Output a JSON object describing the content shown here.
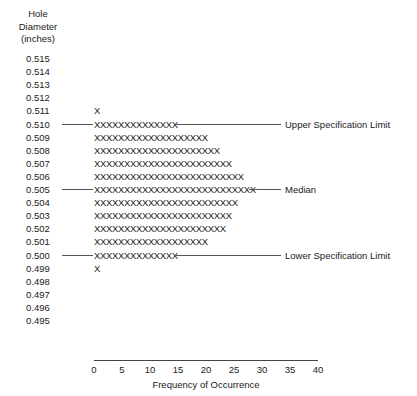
{
  "chart_data": {
    "type": "bar",
    "orientation": "horizontal",
    "title": "",
    "ylabel": "Hole Diameter (inches)",
    "xlabel": "Frequency of Occurrence",
    "xlim": [
      0,
      40
    ],
    "xticks": [
      0,
      5,
      10,
      15,
      20,
      25,
      30,
      35,
      40
    ],
    "grid": false,
    "legend": false,
    "mark_glyph": "X",
    "categories": [
      "0.515",
      "0.514",
      "0.513",
      "0.512",
      "0.511",
      "0.510",
      "0.509",
      "0.508",
      "0.507",
      "0.506",
      "0.505",
      "0.504",
      "0.503",
      "0.502",
      "0.501",
      "0.500",
      "0.499",
      "0.498",
      "0.497",
      "0.496",
      "0.495"
    ],
    "values": [
      0,
      0,
      0,
      0,
      1,
      14,
      19,
      21,
      23,
      25,
      27,
      24,
      23,
      22,
      19,
      14,
      1,
      0,
      0,
      0,
      0
    ],
    "annotations": [
      {
        "category": "0.510",
        "text": "Upper Specification Limit"
      },
      {
        "category": "0.505",
        "text": "Median"
      },
      {
        "category": "0.500",
        "text": "Lower Specification Limit"
      }
    ]
  },
  "y_axis_title": {
    "line1": "Hole",
    "line2": "Diameter",
    "line3": "(inches)"
  },
  "x_axis": {
    "title": "Frequency of Occurrence",
    "ticks": [
      "0",
      "5",
      "10",
      "15",
      "20",
      "25",
      "30",
      "35",
      "40"
    ]
  },
  "rows": [
    {
      "label": "0.515",
      "marks": "",
      "annotation": ""
    },
    {
      "label": "0.514",
      "marks": "",
      "annotation": ""
    },
    {
      "label": "0.513",
      "marks": "",
      "annotation": ""
    },
    {
      "label": "0.512",
      "marks": "",
      "annotation": ""
    },
    {
      "label": "0.511",
      "marks": "X",
      "annotation": ""
    },
    {
      "label": "0.510",
      "marks": "XXXXXXXXXXXXXX",
      "annotation": "Upper Specification Limit"
    },
    {
      "label": "0.509",
      "marks": "XXXXXXXXXXXXXXXXXXX",
      "annotation": ""
    },
    {
      "label": "0.508",
      "marks": "XXXXXXXXXXXXXXXXXXXXX",
      "annotation": ""
    },
    {
      "label": "0.507",
      "marks": "XXXXXXXXXXXXXXXXXXXXXXX",
      "annotation": ""
    },
    {
      "label": "0.506",
      "marks": "XXXXXXXXXXXXXXXXXXXXXXXXX",
      "annotation": ""
    },
    {
      "label": "0.505",
      "marks": "XXXXXXXXXXXXXXXXXXXXXXXXXXX",
      "annotation": "Median"
    },
    {
      "label": "0.504",
      "marks": "XXXXXXXXXXXXXXXXXXXXXXXX",
      "annotation": ""
    },
    {
      "label": "0.503",
      "marks": "XXXXXXXXXXXXXXXXXXXXXXX",
      "annotation": ""
    },
    {
      "label": "0.502",
      "marks": "XXXXXXXXXXXXXXXXXXXXXX",
      "annotation": ""
    },
    {
      "label": "0.501",
      "marks": "XXXXXXXXXXXXXXXXXXX",
      "annotation": ""
    },
    {
      "label": "0.500",
      "marks": "XXXXXXXXXXXXXX",
      "annotation": "Lower Specification Limit"
    },
    {
      "label": "0.499",
      "marks": "X",
      "annotation": ""
    },
    {
      "label": "0.498",
      "marks": "",
      "annotation": ""
    },
    {
      "label": "0.497",
      "marks": "",
      "annotation": ""
    },
    {
      "label": "0.496",
      "marks": "",
      "annotation": ""
    },
    {
      "label": "0.495",
      "marks": "",
      "annotation": ""
    }
  ],
  "colors": {
    "ink": "#1a1a1a",
    "rule": "#555555",
    "axis": "#444444",
    "background": "#ffffff"
  }
}
